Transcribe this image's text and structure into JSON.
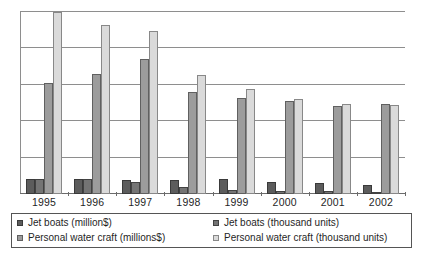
{
  "chart_data": {
    "type": "bar",
    "title": "",
    "subtitle": "",
    "xlabel": "",
    "ylabel": "",
    "grid": true,
    "legend_position": "bottom",
    "categories": [
      "1995",
      "1996",
      "1997",
      "1998",
      "1999",
      "2000",
      "2001",
      "2002"
    ],
    "ylim": [
      0,
      5
    ],
    "y_gridline_values": [
      1,
      2,
      3,
      4,
      5
    ],
    "y_tick_labels": [],
    "series": [
      {
        "name": "Jet boats (million$)",
        "color": "#5c5c5c",
        "values": [
          0.4,
          0.4,
          0.38,
          0.38,
          0.42,
          0.33,
          0.3,
          0.25
        ]
      },
      {
        "name": "Jet boats (thousand units)",
        "color": "#747474",
        "values": [
          0.42,
          0.4,
          0.33,
          0.18,
          0.12,
          0.08,
          0.07,
          0.06
        ]
      },
      {
        "name": "Personal water craft (millions$)",
        "color": "#9c9c9c",
        "values": [
          3.05,
          3.3,
          3.72,
          2.8,
          2.63,
          2.55,
          2.42,
          2.48
        ]
      },
      {
        "name": "Personal water craft (thousand units)",
        "color": "#dadada",
        "values": [
          5.0,
          4.65,
          4.48,
          3.28,
          2.88,
          2.62,
          2.48,
          2.45
        ]
      }
    ]
  },
  "legend": {
    "entries": [
      {
        "label": "Jet boats (million$)",
        "swatch": "s0"
      },
      {
        "label": "Jet boats (thousand units)",
        "swatch": "s1"
      },
      {
        "label": "Personal water craft (millions$)",
        "swatch": "s2"
      },
      {
        "label": "Personal water craft (thousand units)",
        "swatch": "s3"
      }
    ]
  },
  "colors": {
    "series_dark": "#5c5c5c",
    "series_mid_dark": "#747474",
    "series_mid": "#9c9c9c",
    "series_light": "#dadada",
    "gridline": "#8e8e8e",
    "axis": "#6b6b6b",
    "text": "#1f1f1f",
    "background": "#ffffff"
  }
}
